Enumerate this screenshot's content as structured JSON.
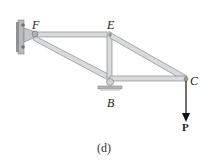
{
  "figure": {
    "caption": "(d)",
    "joints": {
      "F": "F",
      "E": "E",
      "B": "B",
      "C": "C"
    },
    "load_label": "P",
    "colors": {
      "member_fill": "#d9dadb",
      "member_edge": "#8a8c8e",
      "wall": "#a7a9ab",
      "arrow": "#111111"
    }
  }
}
